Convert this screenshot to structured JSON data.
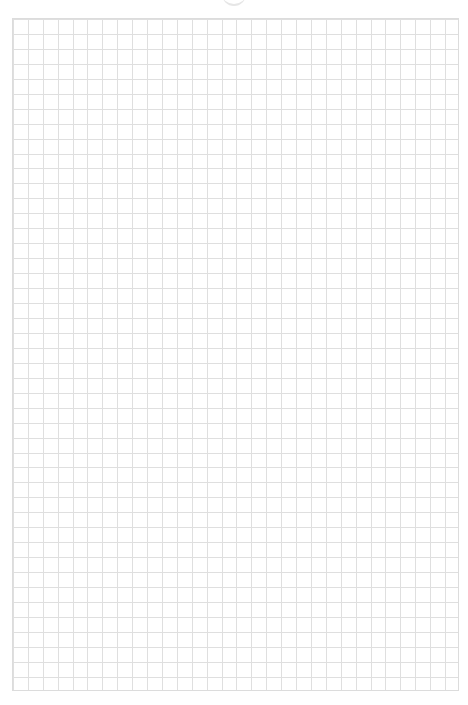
{
  "page": {
    "type": "graph-paper",
    "grid": {
      "columns": 30,
      "rows": 45,
      "line_color": "#dcdcdc"
    },
    "background_color": "#ffffff"
  }
}
